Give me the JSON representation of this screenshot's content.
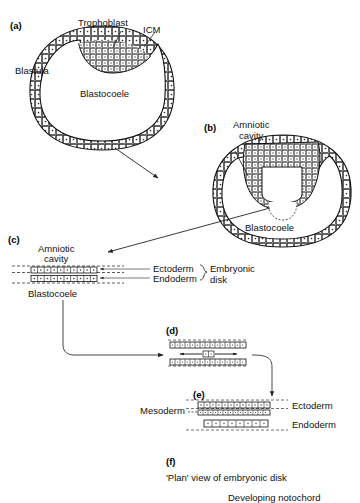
{
  "figure": {
    "panels": [
      {
        "id": "a",
        "label": "(a)"
      },
      {
        "id": "b",
        "label": "(b)"
      },
      {
        "id": "c",
        "label": "(c)"
      },
      {
        "id": "d",
        "label": "(d)"
      },
      {
        "id": "e",
        "label": "(e)"
      },
      {
        "id": "f",
        "label": "(f)"
      }
    ]
  },
  "panel_a": {
    "id": "(a)",
    "title_left": "Blastula",
    "label_trophoblast": "Trophoblast",
    "label_icm": "ICM",
    "label_blastocoele": "Blastocoele"
  },
  "panel_b": {
    "id": "(b)",
    "label_amniotic_cavity_line1": "Amniotic",
    "label_amniotic_cavity_line2": "cavity",
    "label_blastocoele": "Blastocoele"
  },
  "panel_c": {
    "id": "(c)",
    "label_amniotic_cavity_line1": "Amniotic",
    "label_amniotic_cavity_line2": "cavity",
    "label_blastocoele": "Blastocoele",
    "label_ectoderm": "Ectoderm",
    "label_endoderm": "Endoderm",
    "label_embryonic_line1": "Embryonic",
    "label_embryonic_line2": "disk"
  },
  "panel_d": {
    "id": "(d)"
  },
  "panel_e": {
    "id": "(e)",
    "label_mesoderm": "Mesoderm",
    "label_ectoderm": "Ectoderm",
    "label_endoderm": "Endoderm"
  },
  "panel_f": {
    "id": "(f)",
    "caption": "'Plan' view of embryonic disk",
    "label_notochord": "Developing notochord"
  },
  "colors": {
    "ink": "#000000",
    "background": "#ffffff",
    "cell_fill": "#ffffff",
    "line": "#1a1a1a"
  }
}
